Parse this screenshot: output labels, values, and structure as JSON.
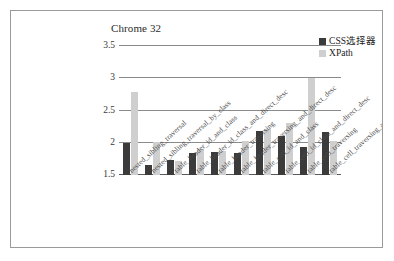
{
  "chart_data": {
    "type": "bar",
    "title": "Chrome 32",
    "xlabel": "",
    "ylabel": "",
    "ylim": [
      1.5,
      3.5
    ],
    "yticks": [
      "1.5",
      "2",
      "2.5",
      "3",
      "3.5"
    ],
    "grid": true,
    "legend_position": "top-right",
    "categories": [
      "nested_sibling_traversal",
      "nested_sibling_traversal_by_class",
      "table_header_id_and_class",
      "table_header_id_class_and_direct_desc",
      "table_header_traversing",
      "table_header_traversing_and_direct_desc",
      "table_cell_id_and_class",
      "table_cell_id_class_and_direct_desc",
      "table_cell_traversing",
      "table_cell_traversing_and_direct_desc"
    ],
    "series": [
      {
        "name": "CSS选择器",
        "color": "#3b3b3b",
        "values": [
          2.0,
          1.66,
          1.73,
          1.84,
          1.85,
          1.84,
          2.19,
          2.1,
          1.94,
          2.17
        ]
      },
      {
        "name": "XPath",
        "color": "#cfcfcf",
        "values": [
          2.79,
          2.01,
          1.71,
          1.9,
          1.87,
          2.03,
          2.22,
          2.31,
          3.01,
          2.02
        ]
      }
    ]
  },
  "legend": {
    "items": [
      {
        "label": "CSS选择器",
        "color": "#3b3b3b"
      },
      {
        "label": "XPath",
        "color": "#cfcfcf"
      }
    ]
  }
}
